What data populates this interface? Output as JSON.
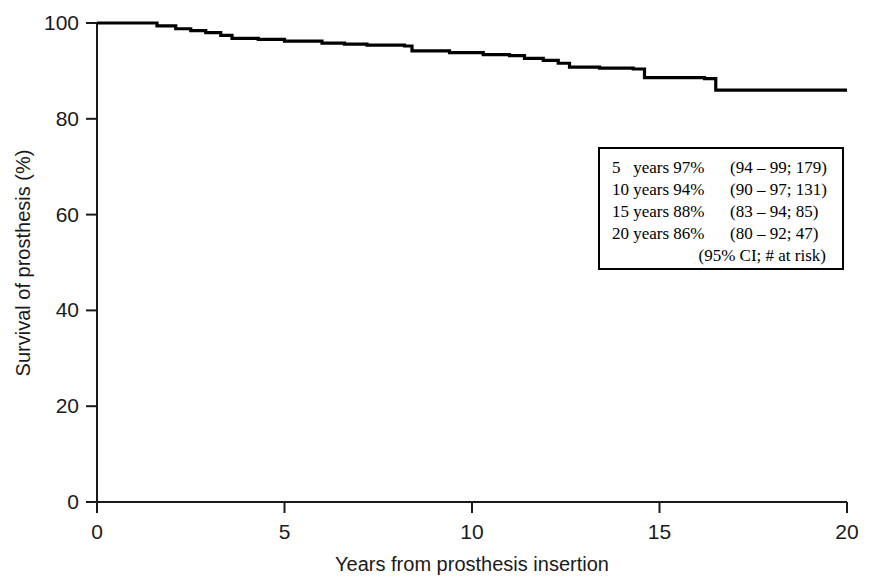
{
  "chart_data": {
    "type": "line",
    "subtype": "kaplan-meier-step",
    "title": "",
    "xlabel": "Years from prosthesis insertion",
    "ylabel": "Survival of prosthesis (%)",
    "xlim": [
      0,
      20
    ],
    "ylim": [
      0,
      100
    ],
    "xticks": [
      0,
      5,
      10,
      15,
      20
    ],
    "xtick_labels": [
      "0",
      "5",
      "10",
      "15",
      "20"
    ],
    "yticks": [
      0,
      20,
      40,
      60,
      80,
      100
    ],
    "ytick_labels": [
      "0",
      "20",
      "40",
      "60",
      "80",
      "100"
    ],
    "grid": false,
    "legend_position": "inside-right",
    "series": [
      {
        "name": "Survival of prosthesis",
        "color": "#000000",
        "x": [
          0,
          1.0,
          1.6,
          2.1,
          2.5,
          2.9,
          3.3,
          3.6,
          4.3,
          5.0,
          6.0,
          6.6,
          7.2,
          8.2,
          8.4,
          9.4,
          10.3,
          11.0,
          11.4,
          11.9,
          12.3,
          12.6,
          13.4,
          14.3,
          14.6,
          16.2,
          16.5,
          20.0
        ],
        "y": [
          100,
          100,
          99.4,
          98.8,
          98.4,
          98.0,
          97.4,
          96.8,
          96.6,
          96.2,
          95.8,
          95.6,
          95.4,
          95.2,
          94.2,
          93.8,
          93.4,
          93.2,
          92.6,
          92.2,
          91.6,
          90.8,
          90.6,
          90.4,
          88.6,
          88.4,
          86.0,
          86.0
        ]
      }
    ]
  },
  "legend": {
    "rows": [
      {
        "left": "5   years 97%",
        "right": "(94 – 99; 179)"
      },
      {
        "left": "10 years 94%",
        "right": "(90 – 97; 131)"
      },
      {
        "left": "15 years 88%",
        "right": "(83 – 94; 85)"
      },
      {
        "left": "20 years 86%",
        "right": "(80 – 92; 47)"
      }
    ],
    "footnote": "(95% CI; # at risk)"
  }
}
